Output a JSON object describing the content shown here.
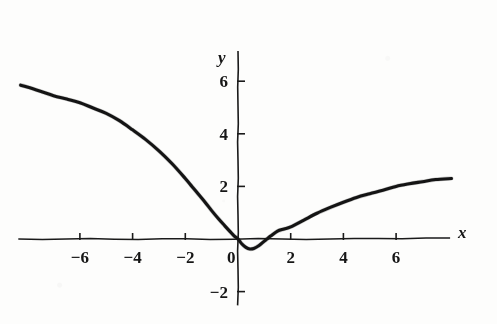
{
  "figure": {
    "background_color": "#fdfdfc",
    "ink_color": "#141414"
  },
  "chart_data": {
    "type": "line",
    "title": "",
    "subtitle": "",
    "xlabel": "x",
    "ylabel": "y",
    "xlim": [
      -8.3,
      8.4
    ],
    "ylim": [
      -2.6,
      7.3
    ],
    "xticks": [
      -6,
      -4,
      -2,
      0,
      2,
      4,
      6
    ],
    "yticks": [
      -2,
      2,
      4,
      6
    ],
    "xticklabels": [
      "−6",
      "−4",
      "−2",
      "0",
      "2",
      "4",
      "6"
    ],
    "yticklabels": [
      "−2",
      "2",
      "4",
      "6"
    ],
    "grid": false,
    "legend": null,
    "axes_style": "centered-spines-with-arrowless-ends",
    "annotations": [],
    "series": [
      {
        "name": "curve",
        "description": "smooth curve decreasing steeply from upper-left, reaching a shallow minimum just below the x-axis near x = 0.5, then rising concavely and flattening toward y = 2.3",
        "minimum": {
          "x": 0.45,
          "y": -0.38
        },
        "zero_crossings": [
          0.0,
          1.1
        ],
        "points": [
          [
            -8.25,
            5.85
          ],
          [
            -8.0,
            5.78
          ],
          [
            -7.5,
            5.62
          ],
          [
            -7.0,
            5.45
          ],
          [
            -6.5,
            5.32
          ],
          [
            -6.0,
            5.18
          ],
          [
            -5.5,
            4.98
          ],
          [
            -5.0,
            4.78
          ],
          [
            -4.5,
            4.5
          ],
          [
            -4.0,
            4.15
          ],
          [
            -3.5,
            3.78
          ],
          [
            -3.0,
            3.35
          ],
          [
            -2.5,
            2.86
          ],
          [
            -2.0,
            2.3
          ],
          [
            -1.75,
            2.0
          ],
          [
            -1.5,
            1.7
          ],
          [
            -1.25,
            1.4
          ],
          [
            -1.0,
            1.08
          ],
          [
            -0.75,
            0.78
          ],
          [
            -0.5,
            0.5
          ],
          [
            -0.3,
            0.28
          ],
          [
            -0.15,
            0.12
          ],
          [
            0.0,
            0.0
          ],
          [
            0.15,
            -0.19
          ],
          [
            0.3,
            -0.32
          ],
          [
            0.45,
            -0.38
          ],
          [
            0.6,
            -0.36
          ],
          [
            0.8,
            -0.25
          ],
          [
            1.0,
            -0.08
          ],
          [
            1.1,
            0.0
          ],
          [
            1.25,
            0.12
          ],
          [
            1.5,
            0.3
          ],
          [
            1.75,
            0.38
          ],
          [
            2.0,
            0.46
          ],
          [
            2.5,
            0.72
          ],
          [
            3.0,
            0.98
          ],
          [
            3.5,
            1.2
          ],
          [
            4.0,
            1.4
          ],
          [
            4.5,
            1.58
          ],
          [
            5.0,
            1.72
          ],
          [
            5.5,
            1.85
          ],
          [
            6.0,
            2.0
          ],
          [
            6.5,
            2.1
          ],
          [
            7.0,
            2.18
          ],
          [
            7.5,
            2.26
          ],
          [
            8.1,
            2.3
          ]
        ]
      }
    ]
  },
  "labels": {
    "x_axis_label": "x",
    "y_axis_label": "y"
  }
}
